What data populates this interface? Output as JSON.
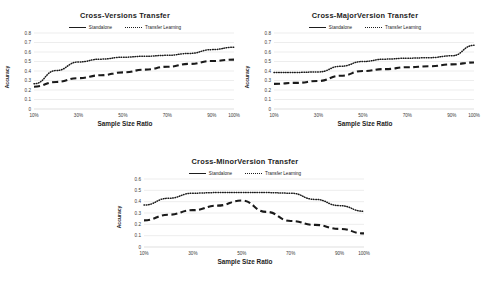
{
  "figure": {
    "background": "#ffffff",
    "line_color": "#1a1a1a",
    "grid_color": "#d6d6d6"
  },
  "legend": {
    "standalone_label": "Standalone",
    "transfer_label": "Transfer Learning"
  },
  "chart_data": [
    {
      "type": "line",
      "id": "cross-versions",
      "title": "Cross-Versions Transfer",
      "xlabel": "Sample Size Ratio",
      "ylabel": "Accuracy",
      "categories": [
        "10%",
        "20%",
        "30%",
        "40%",
        "50%",
        "60%",
        "70%",
        "80%",
        "90%",
        "100%"
      ],
      "x_tick_labels": [
        "10%",
        "30%",
        "50%",
        "70%",
        "90%",
        "100%"
      ],
      "y_tick_labels": [
        "0",
        "0.1",
        "0.2",
        "0.3",
        "0.4",
        "0.5",
        "0.6",
        "0.7",
        "0.8"
      ],
      "ylim": [
        0,
        0.8
      ],
      "ytick_step": 0.1,
      "grid": true,
      "legend_position": "top-center",
      "series": [
        {
          "name": "Standalone",
          "style": "dashed",
          "values": [
            0.235,
            0.285,
            0.325,
            0.355,
            0.385,
            0.415,
            0.445,
            0.475,
            0.505,
            0.52
          ]
        },
        {
          "name": "Transfer Learning",
          "style": "dotted",
          "values": [
            0.265,
            0.405,
            0.495,
            0.525,
            0.545,
            0.555,
            0.565,
            0.585,
            0.625,
            0.65
          ]
        }
      ]
    },
    {
      "type": "line",
      "id": "cross-majorversion",
      "title": "Cross-MajorVersion Transfer",
      "xlabel": "Sample Size Ratio",
      "ylabel": "Accuracy",
      "categories": [
        "10%",
        "20%",
        "30%",
        "40%",
        "50%",
        "60%",
        "70%",
        "80%",
        "90%",
        "100%"
      ],
      "x_tick_labels": [
        "10%",
        "30%",
        "50%",
        "70%",
        "90%",
        "100%"
      ],
      "y_tick_labels": [
        "0",
        "0.1",
        "0.2",
        "0.3",
        "0.4",
        "0.5",
        "0.6",
        "0.7",
        "0.8"
      ],
      "ylim": [
        0,
        0.8
      ],
      "ytick_step": 0.1,
      "grid": true,
      "legend_position": "top-center",
      "series": [
        {
          "name": "Standalone",
          "style": "dashed",
          "values": [
            0.265,
            0.275,
            0.295,
            0.35,
            0.4,
            0.42,
            0.44,
            0.45,
            0.47,
            0.49
          ]
        },
        {
          "name": "Transfer Learning",
          "style": "dotted",
          "values": [
            0.385,
            0.385,
            0.39,
            0.45,
            0.5,
            0.525,
            0.535,
            0.54,
            0.56,
            0.67
          ]
        }
      ]
    },
    {
      "type": "line",
      "id": "cross-minorversion",
      "title": "Cross-MinorVersion Transfer",
      "xlabel": "Sample Size Ratio",
      "ylabel": "Accuracy",
      "categories": [
        "10%",
        "20%",
        "30%",
        "40%",
        "50%",
        "60%",
        "70%",
        "80%",
        "90%",
        "100%"
      ],
      "x_tick_labels": [
        "10%",
        "30%",
        "50%",
        "70%",
        "90%",
        "100%"
      ],
      "y_tick_labels": [
        "0",
        "0.1",
        "0.2",
        "0.3",
        "0.4",
        "0.5",
        "0.6"
      ],
      "ylim": [
        0,
        0.6
      ],
      "ytick_step": 0.1,
      "grid": true,
      "legend_position": "top-center",
      "series": [
        {
          "name": "Standalone",
          "style": "dashed",
          "values": [
            0.235,
            0.285,
            0.325,
            0.365,
            0.41,
            0.31,
            0.23,
            0.195,
            0.16,
            0.12
          ]
        },
        {
          "name": "Transfer Learning",
          "style": "dotted",
          "values": [
            0.37,
            0.43,
            0.475,
            0.48,
            0.48,
            0.48,
            0.475,
            0.42,
            0.365,
            0.315
          ]
        }
      ]
    }
  ]
}
